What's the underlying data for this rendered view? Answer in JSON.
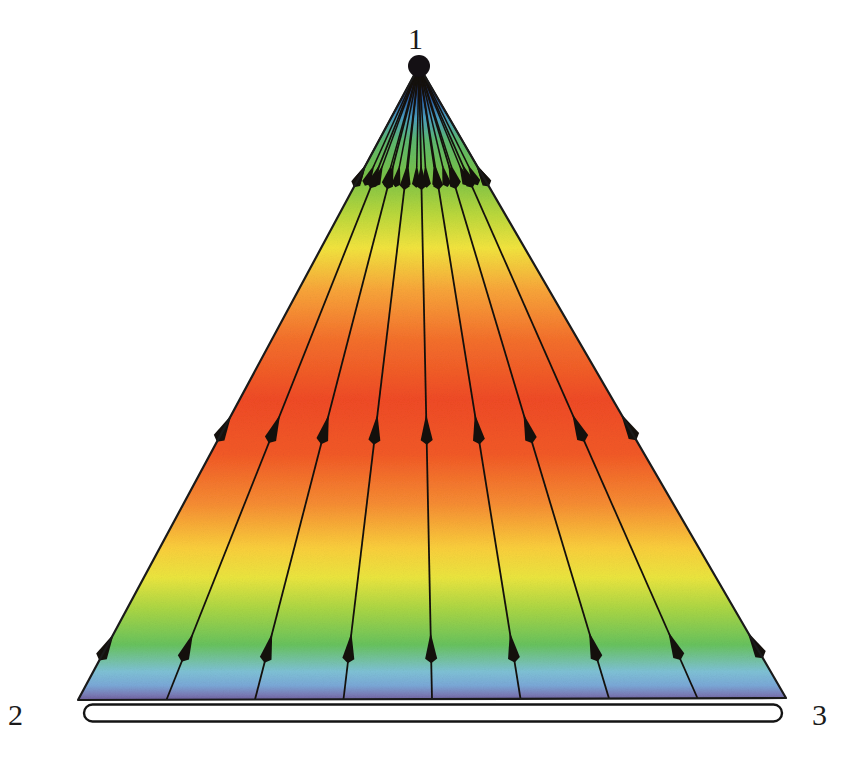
{
  "figure": {
    "background": "#ffffff",
    "width": 849,
    "height": 767
  },
  "labels": {
    "apex": "1",
    "bottom_left": "2",
    "bottom_right": "3"
  },
  "geometry": {
    "apex": {
      "x": 419,
      "y": 66
    },
    "bottom_left": {
      "x": 78,
      "y": 700
    },
    "bottom_right": {
      "x": 786,
      "y": 698
    },
    "apex_dot_radius": 11,
    "outline_color": "#1a1a1a",
    "outline_width": 2.2,
    "base_bar": {
      "shape": "capsule",
      "x1": 84,
      "x2": 782,
      "y": 713,
      "thickness": 17,
      "fill": "#ffffff",
      "stroke": "#141414"
    }
  },
  "rays": {
    "count": 9,
    "description": "straight flow lines from the base edge converging at the apex vertex 1",
    "color": "#14100c",
    "width": 1.8,
    "base_fractions": [
      0.0,
      0.125,
      0.25,
      0.375,
      0.5,
      0.625,
      0.75,
      0.875,
      1.0
    ],
    "arrow_rows": [
      {
        "name": "upper-arrow-row",
        "t": 0.845,
        "arrow_length": 22,
        "arrow_half_width": 5
      },
      {
        "name": "middle-arrow-row",
        "t": 0.45,
        "arrow_length": 26,
        "arrow_half_width": 6
      },
      {
        "name": "lower-arrow-row",
        "t": 0.105,
        "arrow_length": 26,
        "arrow_half_width": 6
      }
    ],
    "apex_fan": {
      "count": 13,
      "description": "short converging strokes packed at the apex",
      "arrow_t": 0.845
    }
  },
  "chart_data": {
    "type": "heatmap",
    "xlabel": "",
    "ylabel": "",
    "legend_position": "none",
    "grid": false,
    "colormap": "jet (rainbow)",
    "mapping": "value varies with vertical position only; rendered as a vertical rainbow gradient clipped to the triangle",
    "color_stops": [
      {
        "y": 66,
        "offset": 0.0,
        "color": "#1b1630",
        "level": "very low"
      },
      {
        "y": 84,
        "offset": 0.03,
        "color": "#23306d",
        "level": "low"
      },
      {
        "y": 100,
        "offset": 0.054,
        "color": "#2c63a8",
        "level": "low"
      },
      {
        "y": 118,
        "offset": 0.082,
        "color": "#4b9fc0",
        "level": "low-mid"
      },
      {
        "y": 140,
        "offset": 0.117,
        "color": "#5cb86f",
        "level": "mid"
      },
      {
        "y": 175,
        "offset": 0.172,
        "color": "#78c248",
        "level": "mid"
      },
      {
        "y": 215,
        "offset": 0.235,
        "color": "#bcd93c",
        "level": "mid-high"
      },
      {
        "y": 248,
        "offset": 0.287,
        "color": "#f3e53f",
        "level": "high"
      },
      {
        "y": 290,
        "offset": 0.353,
        "color": "#f9a63a",
        "level": "high"
      },
      {
        "y": 340,
        "offset": 0.432,
        "color": "#f5702c",
        "level": "very high"
      },
      {
        "y": 400,
        "offset": 0.527,
        "color": "#f04b25",
        "level": "peak"
      },
      {
        "y": 455,
        "offset": 0.613,
        "color": "#f35a27",
        "level": "very high"
      },
      {
        "y": 505,
        "offset": 0.692,
        "color": "#f78e33",
        "level": "high"
      },
      {
        "y": 548,
        "offset": 0.76,
        "color": "#fbcf3c",
        "level": "high"
      },
      {
        "y": 578,
        "offset": 0.807,
        "color": "#ebe63f",
        "level": "mid-high"
      },
      {
        "y": 610,
        "offset": 0.858,
        "color": "#a9d645",
        "level": "mid"
      },
      {
        "y": 645,
        "offset": 0.913,
        "color": "#68c35e",
        "level": "mid"
      },
      {
        "y": 672,
        "offset": 0.955,
        "color": "#7fc2d6",
        "level": "low-mid"
      },
      {
        "y": 686,
        "offset": 0.977,
        "color": "#7ba9d8",
        "level": "low"
      },
      {
        "y": 695,
        "offset": 0.991,
        "color": "#7b7fb9",
        "level": "low"
      },
      {
        "y": 700,
        "offset": 1.0,
        "color": "#6f5f9e",
        "level": "very low"
      }
    ]
  },
  "colors": {
    "accent_red": "#f04b25",
    "accent_orange": "#f78e33",
    "accent_yellow": "#f3e53f",
    "accent_green": "#68c35e",
    "accent_blue": "#2c63a8",
    "accent_purple": "#6f5f9e",
    "ink": "#1a1a1a",
    "paper": "#ffffff"
  }
}
